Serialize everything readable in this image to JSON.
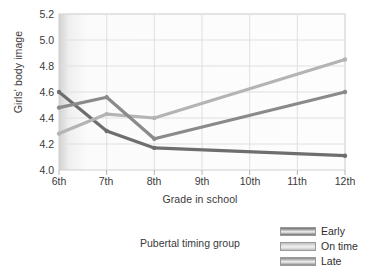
{
  "chart_data": {
    "type": "line",
    "title": "",
    "xlabel": "Grade in school",
    "ylabel": "Girls' body image",
    "categories": [
      "6th",
      "7th",
      "8th",
      "9th",
      "10th",
      "11th",
      "12th"
    ],
    "xticklabels": [
      "6th",
      "7th",
      "8th",
      "9th",
      "10th",
      "11th",
      "12th"
    ],
    "yticklabels": [
      "5.2",
      "5.0",
      "4.8",
      "4.6",
      "4.4",
      "4.2",
      "4.0"
    ],
    "ytickvalues": [
      5.2,
      5.0,
      4.8,
      4.6,
      4.4,
      4.2,
      4.0
    ],
    "ylim": [
      4.0,
      5.2
    ],
    "xlim": [
      "6th",
      "12th"
    ],
    "grid": true,
    "legend_position": "below-right",
    "legend_title": "Pubertal timing group",
    "series": [
      {
        "name": "Early",
        "color": "#6e6e6e",
        "x": [
          "6th",
          "7th",
          "8th",
          "12th"
        ],
        "values": [
          4.6,
          4.3,
          4.17,
          4.11
        ]
      },
      {
        "name": "On time",
        "color": "#b4b4b4",
        "x": [
          "6th",
          "7th",
          "8th",
          "12th"
        ],
        "values": [
          4.28,
          4.43,
          4.4,
          4.85
        ]
      },
      {
        "name": "Late",
        "color": "#8a8a8a",
        "x": [
          "6th",
          "7th",
          "8th",
          "12th"
        ],
        "values": [
          4.48,
          4.56,
          4.24,
          4.6
        ]
      }
    ]
  },
  "legend": {
    "title": "Pubertal timing group",
    "entries": [
      {
        "label": "Early",
        "color": "#6e6e6e"
      },
      {
        "label": "On time",
        "color": "#c0c0c0"
      },
      {
        "label": "Late",
        "color": "#8a8a8a"
      }
    ]
  },
  "axes": {
    "ylabel": "Girls' body image",
    "xlabel": "Grade in school"
  },
  "colors": {
    "plot_background": "#fcfcfc",
    "grid": "#e0e0e0",
    "axis_text": "#3a3a3a",
    "border": "#cccccc"
  }
}
